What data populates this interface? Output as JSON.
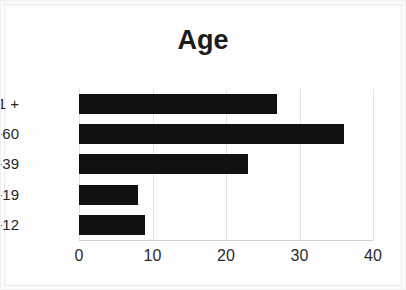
{
  "chart_data": {
    "type": "bar",
    "orientation": "horizontal",
    "title": "Age",
    "xlabel": "",
    "ylabel": "",
    "categories": [
      "0-12",
      "13-19",
      "20-39",
      "40-60",
      "61 +"
    ],
    "values": [
      9,
      8,
      23,
      36,
      27
    ],
    "series": [
      {
        "name": "Age",
        "values": [
          9,
          8,
          23,
          36,
          27
        ]
      }
    ],
    "xlim": [
      0,
      40
    ],
    "xticks": [
      0,
      10,
      20,
      30,
      40
    ],
    "xtick_labels": [
      "0",
      "10",
      "20",
      "30",
      "40"
    ],
    "ytick_labels": [
      "61 +",
      "40-60",
      "20-39",
      "13-19",
      "0-12"
    ],
    "grid": true,
    "grid_axis": "x",
    "legend": false,
    "legend_position": "none",
    "bar_color": "#111111",
    "gridline_color": "#e3e3e3",
    "background_color": "#ffffff",
    "title_color": "#1c1c1c",
    "display_order_top_to_bottom": [
      "61 +",
      "40-60",
      "20-39",
      "13-19",
      "0-12"
    ],
    "display_values_top_to_bottom": [
      27,
      36,
      23,
      8,
      9
    ]
  },
  "axis": {
    "ticks": [
      {
        "label": "0",
        "value": 0
      },
      {
        "label": "10",
        "value": 10
      },
      {
        "label": "20",
        "value": 20
      },
      {
        "label": "30",
        "value": 30
      },
      {
        "label": "40",
        "value": 40
      }
    ]
  },
  "rows": [
    {
      "label": "61 +",
      "value": 27
    },
    {
      "label": "40-60",
      "value": 36
    },
    {
      "label": "20-39",
      "value": 23
    },
    {
      "label": "13-19",
      "value": 8
    },
    {
      "label": "0-12",
      "value": 9
    }
  ]
}
